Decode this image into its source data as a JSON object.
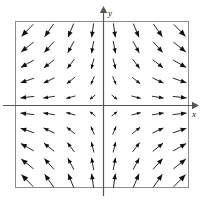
{
  "figure": {
    "title": "",
    "background_color": "#ffffff"
  },
  "axes": {
    "x_label": "x",
    "y_label": "y",
    "x_axis_name": "x-axis",
    "y_axis_name": "y-axis",
    "axis_color": "#555555",
    "frame_color": "#888888",
    "origin_px": [
      103,
      105
    ],
    "frame_px": {
      "left": 15,
      "top": 21,
      "right": 189,
      "bottom": 188
    }
  },
  "chart_data": {
    "type": "scatter",
    "subtype": "vector-field",
    "title": "",
    "xlabel": "x",
    "ylabel": "y",
    "xlim": [
      -4,
      4
    ],
    "ylim": [
      -4,
      4
    ],
    "grid": false,
    "legend": null,
    "arrow_color": "#111111",
    "field_formula": "(dx, dy) = (x, -y)",
    "grid_columns": 8,
    "grid_rows": 10,
    "x": [
      -3.5,
      -2.5,
      -1.5,
      -0.5,
      0.5,
      1.5,
      2.5,
      3.5
    ],
    "y": [
      3.6,
      2.8,
      2.0,
      1.2,
      0.4,
      -0.4,
      -1.2,
      -2.0,
      -2.8,
      -3.6
    ],
    "vectors": [
      {
        "x": -3.5,
        "y": 3.6,
        "u": -3.5,
        "v": -3.6
      },
      {
        "x": -2.5,
        "y": 3.6,
        "u": -2.5,
        "v": -3.6
      },
      {
        "x": -1.5,
        "y": 3.6,
        "u": -1.5,
        "v": -3.6
      },
      {
        "x": -0.5,
        "y": 3.6,
        "u": -0.5,
        "v": -3.6
      },
      {
        "x": 0.5,
        "y": 3.6,
        "u": 0.5,
        "v": -3.6
      },
      {
        "x": 1.5,
        "y": 3.6,
        "u": 1.5,
        "v": -3.6
      },
      {
        "x": 2.5,
        "y": 3.6,
        "u": 2.5,
        "v": -3.6
      },
      {
        "x": 3.5,
        "y": 3.6,
        "u": 3.5,
        "v": -3.6
      },
      {
        "x": -3.5,
        "y": 2.8,
        "u": -3.5,
        "v": -2.8
      },
      {
        "x": -2.5,
        "y": 2.8,
        "u": -2.5,
        "v": -2.8
      },
      {
        "x": -1.5,
        "y": 2.8,
        "u": -1.5,
        "v": -2.8
      },
      {
        "x": -0.5,
        "y": 2.8,
        "u": -0.5,
        "v": -2.8
      },
      {
        "x": 0.5,
        "y": 2.8,
        "u": 0.5,
        "v": -2.8
      },
      {
        "x": 1.5,
        "y": 2.8,
        "u": 1.5,
        "v": -2.8
      },
      {
        "x": 2.5,
        "y": 2.8,
        "u": 2.5,
        "v": -2.8
      },
      {
        "x": 3.5,
        "y": 2.8,
        "u": 3.5,
        "v": -2.8
      },
      {
        "x": -3.5,
        "y": 2.0,
        "u": -3.5,
        "v": -2.0
      },
      {
        "x": -2.5,
        "y": 2.0,
        "u": -2.5,
        "v": -2.0
      },
      {
        "x": -1.5,
        "y": 2.0,
        "u": -1.5,
        "v": -2.0
      },
      {
        "x": -0.5,
        "y": 2.0,
        "u": -0.5,
        "v": -2.0
      },
      {
        "x": 0.5,
        "y": 2.0,
        "u": 0.5,
        "v": -2.0
      },
      {
        "x": 1.5,
        "y": 2.0,
        "u": 1.5,
        "v": -2.0
      },
      {
        "x": 2.5,
        "y": 2.0,
        "u": 2.5,
        "v": -2.0
      },
      {
        "x": 3.5,
        "y": 2.0,
        "u": 3.5,
        "v": -2.0
      },
      {
        "x": -3.5,
        "y": 1.2,
        "u": -3.5,
        "v": -1.2
      },
      {
        "x": -2.5,
        "y": 1.2,
        "u": -2.5,
        "v": -1.2
      },
      {
        "x": -1.5,
        "y": 1.2,
        "u": -1.5,
        "v": -1.2
      },
      {
        "x": -0.5,
        "y": 1.2,
        "u": -0.5,
        "v": -1.2
      },
      {
        "x": 0.5,
        "y": 1.2,
        "u": 0.5,
        "v": -1.2
      },
      {
        "x": 1.5,
        "y": 1.2,
        "u": 1.5,
        "v": -1.2
      },
      {
        "x": 2.5,
        "y": 1.2,
        "u": 2.5,
        "v": -1.2
      },
      {
        "x": 3.5,
        "y": 1.2,
        "u": 3.5,
        "v": -1.2
      },
      {
        "x": -3.5,
        "y": 0.4,
        "u": -3.5,
        "v": -0.4
      },
      {
        "x": -2.5,
        "y": 0.4,
        "u": -2.5,
        "v": -0.4
      },
      {
        "x": -1.5,
        "y": 0.4,
        "u": -1.5,
        "v": -0.4
      },
      {
        "x": -0.5,
        "y": 0.4,
        "u": -0.5,
        "v": -0.4
      },
      {
        "x": 0.5,
        "y": 0.4,
        "u": 0.5,
        "v": -0.4
      },
      {
        "x": 1.5,
        "y": 0.4,
        "u": 1.5,
        "v": -0.4
      },
      {
        "x": 2.5,
        "y": 0.4,
        "u": 2.5,
        "v": -0.4
      },
      {
        "x": 3.5,
        "y": 0.4,
        "u": 3.5,
        "v": -0.4
      },
      {
        "x": -3.5,
        "y": -0.4,
        "u": -3.5,
        "v": 0.4
      },
      {
        "x": -2.5,
        "y": -0.4,
        "u": -2.5,
        "v": 0.4
      },
      {
        "x": -1.5,
        "y": -0.4,
        "u": -1.5,
        "v": 0.4
      },
      {
        "x": -0.5,
        "y": -0.4,
        "u": -0.5,
        "v": 0.4
      },
      {
        "x": 0.5,
        "y": -0.4,
        "u": 0.5,
        "v": 0.4
      },
      {
        "x": 1.5,
        "y": -0.4,
        "u": 1.5,
        "v": 0.4
      },
      {
        "x": 2.5,
        "y": -0.4,
        "u": 2.5,
        "v": 0.4
      },
      {
        "x": 3.5,
        "y": -0.4,
        "u": 3.5,
        "v": 0.4
      },
      {
        "x": -3.5,
        "y": -1.2,
        "u": -3.5,
        "v": 1.2
      },
      {
        "x": -2.5,
        "y": -1.2,
        "u": -2.5,
        "v": 1.2
      },
      {
        "x": -1.5,
        "y": -1.2,
        "u": -1.5,
        "v": 1.2
      },
      {
        "x": -0.5,
        "y": -1.2,
        "u": -0.5,
        "v": 1.2
      },
      {
        "x": 0.5,
        "y": -1.2,
        "u": 0.5,
        "v": 1.2
      },
      {
        "x": 1.5,
        "y": -1.2,
        "u": 1.5,
        "v": 1.2
      },
      {
        "x": 2.5,
        "y": -1.2,
        "u": 2.5,
        "v": 1.2
      },
      {
        "x": 3.5,
        "y": -1.2,
        "u": 3.5,
        "v": 1.2
      },
      {
        "x": -3.5,
        "y": -2.0,
        "u": -3.5,
        "v": 2.0
      },
      {
        "x": -2.5,
        "y": -2.0,
        "u": -2.5,
        "v": 2.0
      },
      {
        "x": -1.5,
        "y": -2.0,
        "u": -1.5,
        "v": 2.0
      },
      {
        "x": -0.5,
        "y": -2.0,
        "u": -0.5,
        "v": 2.0
      },
      {
        "x": 0.5,
        "y": -2.0,
        "u": 0.5,
        "v": 2.0
      },
      {
        "x": 1.5,
        "y": -2.0,
        "u": 1.5,
        "v": 2.0
      },
      {
        "x": 2.5,
        "y": -2.0,
        "u": 2.5,
        "v": 2.0
      },
      {
        "x": 3.5,
        "y": -2.0,
        "u": 3.5,
        "v": 2.0
      },
      {
        "x": -3.5,
        "y": -2.8,
        "u": -3.5,
        "v": 2.8
      },
      {
        "x": -2.5,
        "y": -2.8,
        "u": -2.5,
        "v": 2.8
      },
      {
        "x": -1.5,
        "y": -2.8,
        "u": -1.5,
        "v": 2.8
      },
      {
        "x": -0.5,
        "y": -2.8,
        "u": -0.5,
        "v": 2.8
      },
      {
        "x": 0.5,
        "y": -2.8,
        "u": 0.5,
        "v": 2.8
      },
      {
        "x": 1.5,
        "y": -2.8,
        "u": 1.5,
        "v": 2.8
      },
      {
        "x": 2.5,
        "y": -2.8,
        "u": 2.5,
        "v": 2.8
      },
      {
        "x": 3.5,
        "y": -2.8,
        "u": 3.5,
        "v": 2.8
      },
      {
        "x": -3.5,
        "y": -3.6,
        "u": -3.5,
        "v": 3.6
      },
      {
        "x": -2.5,
        "y": -3.6,
        "u": -2.5,
        "v": 3.6
      },
      {
        "x": -1.5,
        "y": -3.6,
        "u": -1.5,
        "v": 3.6
      },
      {
        "x": -0.5,
        "y": -3.6,
        "u": -0.5,
        "v": 3.6
      },
      {
        "x": 0.5,
        "y": -3.6,
        "u": 0.5,
        "v": 3.6
      },
      {
        "x": 1.5,
        "y": -3.6,
        "u": 1.5,
        "v": 3.6
      },
      {
        "x": 2.5,
        "y": -3.6,
        "u": 2.5,
        "v": 3.6
      },
      {
        "x": 3.5,
        "y": -3.6,
        "u": 3.5,
        "v": 3.6
      }
    ]
  }
}
